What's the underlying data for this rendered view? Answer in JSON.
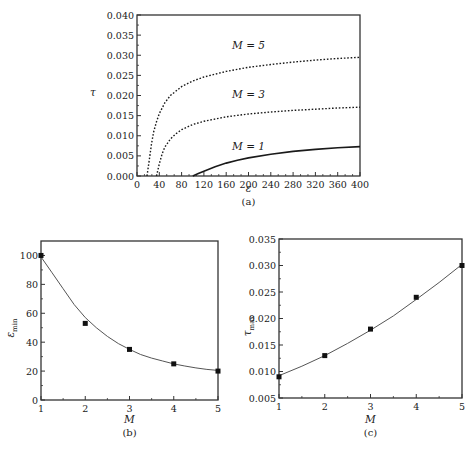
{
  "chart_data": [
    {
      "id": "a",
      "type": "line",
      "caption": "(a)",
      "xlabel": "ε",
      "ylabel": "τ",
      "xlim": [
        0,
        400
      ],
      "ylim": [
        0.0,
        0.04
      ],
      "xticks": [
        "0",
        "40",
        "80",
        "120",
        "160",
        "200",
        "240",
        "280",
        "320",
        "360",
        "400"
      ],
      "yticks": [
        "0.000",
        "0.005",
        "0.010",
        "0.015",
        "0.020",
        "0.025",
        "0.030",
        "0.035",
        "0.040"
      ],
      "grid": false,
      "series": [
        {
          "name": "M=5",
          "style": "dotted",
          "x": [
            18,
            22,
            26,
            30,
            35,
            40,
            50,
            60,
            80,
            100,
            120,
            160,
            200,
            240,
            280,
            320,
            360,
            400
          ],
          "y": [
            0.0,
            0.004,
            0.008,
            0.011,
            0.0135,
            0.0155,
            0.0182,
            0.02,
            0.0222,
            0.0236,
            0.0246,
            0.026,
            0.027,
            0.0277,
            0.0283,
            0.0288,
            0.0292,
            0.0295
          ]
        },
        {
          "name": "M=3",
          "style": "dotted",
          "x": [
            35,
            40,
            45,
            50,
            60,
            70,
            80,
            100,
            120,
            160,
            200,
            240,
            280,
            320,
            360,
            400
          ],
          "y": [
            0.0,
            0.003,
            0.0055,
            0.0072,
            0.0092,
            0.0105,
            0.0115,
            0.0128,
            0.0136,
            0.0147,
            0.0154,
            0.0159,
            0.0163,
            0.0166,
            0.0169,
            0.0171
          ]
        },
        {
          "name": "M=1",
          "style": "solid",
          "x": [
            100,
            110,
            120,
            140,
            160,
            180,
            200,
            240,
            280,
            320,
            360,
            400
          ],
          "y": [
            0.0,
            0.0006,
            0.0012,
            0.0023,
            0.0032,
            0.0039,
            0.0045,
            0.0054,
            0.0061,
            0.0066,
            0.007,
            0.0073
          ]
        }
      ],
      "annotations": [
        {
          "text": "M = 5",
          "x": 200,
          "y": 0.0315
        },
        {
          "text": "M = 3",
          "x": 200,
          "y": 0.0195
        },
        {
          "text": "M = 1",
          "x": 200,
          "y": 0.0065
        }
      ]
    },
    {
      "id": "b",
      "type": "scatter",
      "caption": "(b)",
      "xlabel": "M",
      "ylabel": "ε_min",
      "xlim": [
        1,
        5
      ],
      "ylim": [
        0,
        110
      ],
      "xticks": [
        "1",
        "2",
        "3",
        "4",
        "5"
      ],
      "yticks": [
        "0",
        "20",
        "40",
        "60",
        "80",
        "100"
      ],
      "grid": false,
      "points": {
        "x": [
          1,
          2,
          3,
          4,
          5
        ],
        "y": [
          100,
          53,
          35,
          25,
          20
        ]
      },
      "fit": {
        "x": [
          1,
          1.25,
          1.5,
          1.75,
          2,
          2.25,
          2.5,
          2.75,
          3,
          3.25,
          3.5,
          3.75,
          4,
          4.25,
          4.5,
          4.75,
          5
        ],
        "y": [
          99,
          88,
          77,
          66,
          57,
          50,
          44,
          39,
          35,
          31.5,
          29,
          27,
          25,
          23.5,
          22.2,
          21.2,
          20.5
        ]
      }
    },
    {
      "id": "c",
      "type": "scatter",
      "caption": "(c)",
      "xlabel": "M",
      "ylabel": "τ_max",
      "xlim": [
        1,
        5
      ],
      "ylim": [
        0.005,
        0.035
      ],
      "xticks": [
        "1",
        "2",
        "3",
        "4",
        "5"
      ],
      "yticks": [
        "0.005",
        "0.010",
        "0.015",
        "0.020",
        "0.025",
        "0.030",
        "0.035"
      ],
      "grid": false,
      "points": {
        "x": [
          1,
          2,
          3,
          4,
          5
        ],
        "y": [
          0.009,
          0.013,
          0.018,
          0.024,
          0.03
        ]
      },
      "fit": {
        "x": [
          1,
          1.5,
          2,
          2.5,
          3,
          3.5,
          4,
          4.5,
          5
        ],
        "y": [
          0.0092,
          0.011,
          0.013,
          0.0153,
          0.0178,
          0.0205,
          0.0236,
          0.0268,
          0.0302
        ]
      }
    }
  ]
}
